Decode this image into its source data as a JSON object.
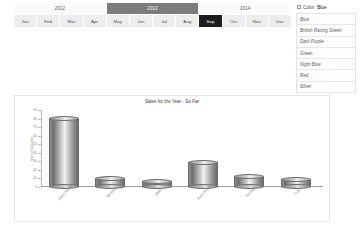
{
  "slicers": {
    "years": [
      {
        "label": "2012",
        "selected": false
      },
      {
        "label": "2013",
        "selected": true
      },
      {
        "label": "2014",
        "selected": false
      }
    ],
    "months": [
      {
        "label": "Jan",
        "selected": false
      },
      {
        "label": "Feb",
        "selected": false
      },
      {
        "label": "Mar",
        "selected": false
      },
      {
        "label": "Apr",
        "selected": false
      },
      {
        "label": "May",
        "selected": false
      },
      {
        "label": "Jun",
        "selected": false
      },
      {
        "label": "Jul",
        "selected": false
      },
      {
        "label": "Aug",
        "selected": false
      },
      {
        "label": "Sep",
        "selected": true
      },
      {
        "label": "Oct",
        "selected": false
      },
      {
        "label": "Nov",
        "selected": false
      },
      {
        "label": "Dec",
        "selected": false
      }
    ]
  },
  "legend": {
    "icon": "filter-icon",
    "header_label": "Color:",
    "header_value": "Blue",
    "items": [
      {
        "label": "Blue"
      },
      {
        "label": "British Racing Green"
      },
      {
        "label": "Dark Purple"
      },
      {
        "label": "Green"
      },
      {
        "label": "Night Blue"
      },
      {
        "label": "Red"
      },
      {
        "label": "Silver"
      }
    ]
  },
  "chart_data": {
    "type": "bar",
    "title": "Sales for the Year - So Far",
    "xlabel": "",
    "ylabel": "Sum of Quantity",
    "categories": [
      "Aston Martin",
      "Bentley",
      "AMG",
      "Rolls Royce",
      "Triumph",
      "TVR"
    ],
    "values": [
      80,
      10,
      6,
      28,
      12,
      8
    ],
    "ylim": [
      0,
      90
    ],
    "yticks": [
      0,
      10,
      20,
      30,
      40,
      50,
      60,
      70,
      80,
      90
    ],
    "grid": false,
    "legend": "none"
  }
}
